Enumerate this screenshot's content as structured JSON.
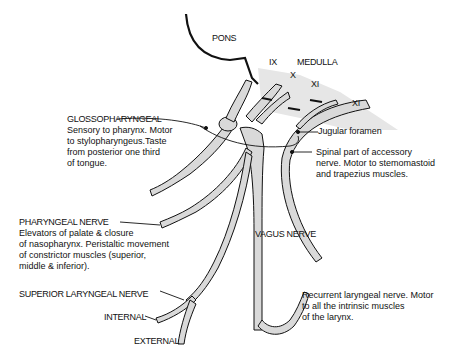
{
  "diagram": {
    "colors": {
      "nerve_fill": "#d9d9d9",
      "outline": "#111111",
      "background": "#ffffff"
    },
    "labels": {
      "pons": "PONS",
      "medulla": "MEDULLA",
      "root_ix": "IX",
      "root_x": "X",
      "root_xi_upper": "XI",
      "root_xi_lower": "XI",
      "jugular_foramen": "Jugular foramen",
      "vagus_nerve": "VAGUS NERVE",
      "internal": "INTERNAL",
      "external": "EXTERNAL"
    },
    "glossopharyngeal": {
      "title": "GLOSSOPHARYNGEAL",
      "lines": [
        "Sensory to pharynx. Motor",
        "to stylopharyngeus.Taste",
        "from posterior one third",
        "of tongue."
      ]
    },
    "accessory": {
      "lines": [
        "Spinal part of accessory",
        "nerve. Motor to stemomastoid",
        "and trapezius muscles."
      ]
    },
    "pharyngeal": {
      "title": "PHARYNGEAL NERVE",
      "lines": [
        "Elevators of palate & closure",
        "of nasopharynx. Peristaltic movement",
        "of constrictor muscles (superior,",
        "middle & inferior)."
      ]
    },
    "superior_laryngeal": {
      "title": "SUPERIOR LARYNGEAL NERVE"
    },
    "recurrent_laryngeal": {
      "lines": [
        "Recurrent laryngeal nerve. Motor",
        "to all the intrinsic muscles",
        "of the larynx."
      ]
    }
  }
}
